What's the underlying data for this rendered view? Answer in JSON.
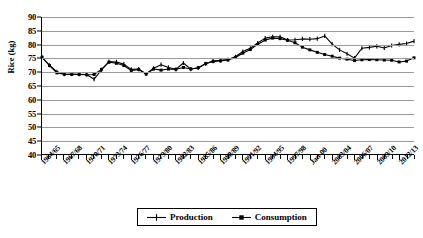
{
  "chart_data": {
    "type": "line",
    "title": "",
    "xlabel": "",
    "ylabel": "Rice (kg)",
    "ylim": [
      40,
      90
    ],
    "ytick_step": 5,
    "yticks": [
      40,
      45,
      50,
      55,
      60,
      65,
      70,
      75,
      80,
      85,
      90
    ],
    "grid": true,
    "legend_position": "bottom",
    "x": [
      "1964/65",
      "1965/66",
      "1966/67",
      "1967/68",
      "1968/69",
      "1969/70",
      "1970/71",
      "1971/72",
      "1972/73",
      "1973/74",
      "1974/75",
      "1975/76",
      "1976/77",
      "1977/78",
      "1978/79",
      "1979/80",
      "1980/81",
      "1981/82",
      "1982/83",
      "1983/84",
      "1984/85",
      "1985/86",
      "1986/87",
      "1987/88",
      "1988/89",
      "1989/90",
      "1990/91",
      "1991/92",
      "1992/93",
      "1993/94",
      "1994/95",
      "1995/96",
      "1996/97",
      "1997/98",
      "1998/99",
      "1999/00",
      "Jan-00",
      "2001/02",
      "2002/03",
      "2003/04",
      "2004/05",
      "2005/06",
      "2006/07",
      "2007/08",
      "2008/09",
      "2009/10",
      "2010/11",
      "2011/12",
      "2012/13",
      "2013/14",
      "2014/15"
    ],
    "xtick_labels": [
      "1964/65",
      "1967/68",
      "1970/71",
      "1973/74",
      "1976/77",
      "1979/80",
      "1982/83",
      "1985/86",
      "1988/89",
      "1991/92",
      "1994/95",
      "1997/98",
      "Jan-00",
      "2003/04",
      "2006/07",
      "2009/10",
      "2012/13"
    ],
    "xtick_label_every": 3,
    "series": [
      {
        "name": "Production",
        "marker": "plus-dash",
        "color": "#000000",
        "values": [
          75.3,
          72.4,
          70.0,
          69.1,
          69.2,
          69.1,
          69.0,
          67.3,
          70.7,
          73.7,
          73.6,
          72.8,
          70.9,
          71.0,
          69.2,
          71.3,
          72.6,
          71.6,
          70.9,
          73.2,
          71.0,
          71.4,
          72.9,
          73.9,
          74.2,
          74.5,
          75.5,
          77.4,
          78.6,
          80.5,
          82.3,
          82.8,
          82.8,
          81.6,
          81.7,
          82.0,
          81.9,
          82.1,
          83.1,
          80.1,
          78.0,
          76.6,
          75.0,
          78.6,
          78.9,
          79.3,
          78.7,
          79.6,
          80.0,
          80.3,
          81.2
        ]
      },
      {
        "name": "Consumption",
        "marker": "square-dash",
        "color": "#000000",
        "values": [
          75.3,
          72.3,
          69.6,
          69.1,
          69.0,
          69.0,
          68.9,
          69.0,
          70.9,
          73.5,
          73.1,
          72.3,
          70.5,
          70.8,
          69.2,
          71.0,
          70.6,
          71.0,
          70.9,
          71.6,
          71.0,
          71.5,
          73.0,
          73.8,
          74.0,
          74.3,
          75.2,
          76.8,
          78.1,
          80.0,
          81.6,
          82.3,
          82.1,
          81.5,
          80.6,
          79.0,
          78.0,
          77.1,
          76.3,
          75.7,
          75.0,
          74.6,
          74.1,
          74.4,
          74.5,
          74.4,
          74.3,
          74.2,
          73.6,
          73.9,
          75.1
        ]
      }
    ]
  },
  "legend": {
    "production_label": "Production",
    "consumption_label": "Consumption"
  }
}
